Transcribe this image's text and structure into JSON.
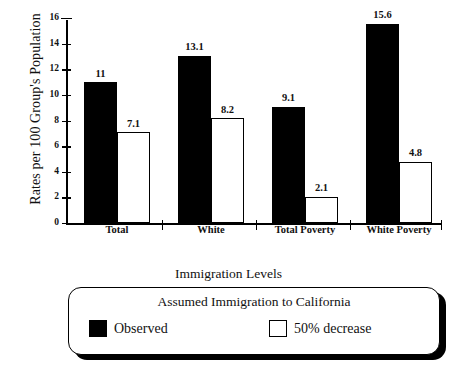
{
  "chart_data": {
    "type": "bar",
    "title": "",
    "xlabel": "",
    "ylabel": "Rates per 100 Group's Population",
    "ylim": [
      0,
      16
    ],
    "yticks": [
      0,
      2,
      4,
      6,
      8,
      10,
      12,
      14,
      16
    ],
    "grid": false,
    "legend_position": "bottom",
    "categories": [
      "Total",
      "White",
      "Total Poverty",
      "White Poverty"
    ],
    "series": [
      {
        "name": "Observed",
        "values": [
          11,
          13.1,
          9.1,
          15.6
        ],
        "color": "#000000",
        "fill": "solid"
      },
      {
        "name": "50% decrease",
        "values": [
          7.1,
          8.2,
          2.1,
          4.8
        ],
        "color": "#ffffff",
        "fill": "outlined"
      }
    ],
    "data_labels": [
      [
        "11",
        "13.1",
        "9.1",
        "15.6"
      ],
      [
        "7.1",
        "8.2",
        "2.1",
        "4.8"
      ]
    ]
  },
  "legend": {
    "outer_title": "Immigration Levels",
    "box_heading": "Assumed Immigration to California",
    "items": [
      {
        "label": "Observed",
        "swatch": "black"
      },
      {
        "label": "50% decrease",
        "swatch": "white"
      }
    ]
  }
}
